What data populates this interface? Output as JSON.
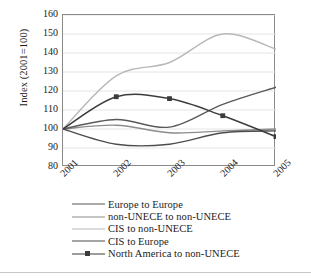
{
  "chart_data": {
    "type": "line",
    "title": "",
    "xlabel": "",
    "ylabel": "Index (2001=100)",
    "x": [
      "2001",
      "2002",
      "2003",
      "2004",
      "2005"
    ],
    "categories": [
      "2001",
      "2002",
      "2003",
      "2004",
      "2005"
    ],
    "ylim": [
      80,
      160
    ],
    "yticks": [
      80,
      90,
      100,
      110,
      120,
      130,
      140,
      150,
      160
    ],
    "grid": true,
    "legend_position": "bottom",
    "series": [
      {
        "name": "Europe to Europe",
        "values": [
          100,
          105,
          101,
          113,
          122
        ],
        "color": "#595959",
        "marker": false
      },
      {
        "name": "non-UNECE to non-UNECE",
        "values": [
          100,
          102,
          98,
          99,
          100
        ],
        "color": "#8c8c8c",
        "marker": false
      },
      {
        "name": "CIS to non-UNECE",
        "values": [
          100,
          128,
          135,
          150,
          142
        ],
        "color": "#b8b8b8",
        "marker": false
      },
      {
        "name": "CIS to Europe",
        "values": [
          100,
          92,
          92,
          98,
          99
        ],
        "color": "#4d4d4d",
        "marker": false
      },
      {
        "name": "North America to non-UNECE",
        "values": [
          100,
          117,
          116,
          107,
          96
        ],
        "color": "#3c3c3c",
        "marker": true
      }
    ]
  },
  "axis": {
    "y_title": "Index (2001=100)",
    "y_tick_labels": [
      "160",
      "150",
      "140",
      "130",
      "120",
      "110",
      "100",
      "90",
      "80"
    ],
    "x_tick_labels": [
      "2001",
      "2002",
      "2003",
      "2004",
      "2005"
    ]
  },
  "legend": {
    "items": [
      {
        "label": "Europe to Europe"
      },
      {
        "label": "non-UNECE to non-UNECE"
      },
      {
        "label": "CIS to non-UNECE"
      },
      {
        "label": "CIS to Europe"
      },
      {
        "label": "North America to non-UNECE"
      }
    ]
  },
  "colors": {
    "frame": "#8a8a8a",
    "gridline": "#e4e4e4",
    "text": "#1a1a1a",
    "background": "#ffffff"
  }
}
